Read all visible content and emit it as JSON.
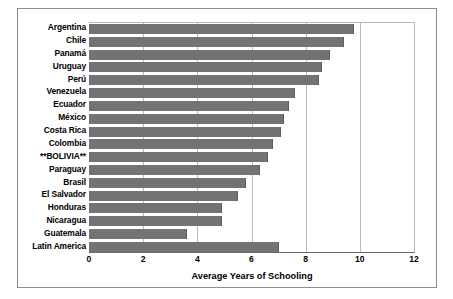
{
  "figure": {
    "frame_color": "#8d8d8d",
    "bar_color": "#737373",
    "grid_color": "#b9b9b9"
  },
  "chart_data": {
    "type": "bar",
    "orientation": "horizontal",
    "title": "",
    "subtitle": "",
    "xlabel": "Average Years of Schooling",
    "ylabel": "",
    "xlim": [
      0,
      12
    ],
    "xticks": [
      0,
      2,
      4,
      6,
      8,
      10,
      12
    ],
    "xtick_labels": [
      "0",
      "2",
      "4",
      "6",
      "8",
      "10",
      "12"
    ],
    "grid": "vertical",
    "legend": "none",
    "highlighted_category": "**BOLIVIA**",
    "categories": [
      "Argentina",
      "Chile",
      "Panamá",
      "Uruguay",
      "Perú",
      "Venezuela",
      "Ecuador",
      "México",
      "Costa Rica",
      "Colombia",
      "**BOLIVIA**",
      "Paraguay",
      "Brasil",
      "El Salvador",
      "Honduras",
      "Nicaragua",
      "Guatemala",
      "Latin America"
    ],
    "values": [
      9.8,
      9.4,
      8.9,
      8.6,
      8.5,
      7.6,
      7.4,
      7.2,
      7.1,
      6.8,
      6.6,
      6.3,
      5.8,
      5.5,
      4.9,
      4.9,
      3.6,
      7.0
    ]
  }
}
